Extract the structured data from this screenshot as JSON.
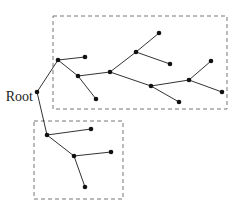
{
  "diagram": {
    "type": "tree",
    "root_label": "Root",
    "colors": {
      "edge": "#333333",
      "node": "#111111",
      "cluster_border": "#777777",
      "background": "#ffffff"
    },
    "nodes": [
      {
        "id": "root",
        "x": 37,
        "y": 92
      },
      {
        "id": "a",
        "x": 58,
        "y": 60
      },
      {
        "id": "a1",
        "x": 85,
        "y": 57
      },
      {
        "id": "b",
        "x": 78,
        "y": 76
      },
      {
        "id": "b1",
        "x": 96,
        "y": 99
      },
      {
        "id": "c",
        "x": 110,
        "y": 72
      },
      {
        "id": "d",
        "x": 136,
        "y": 52
      },
      {
        "id": "d1",
        "x": 159,
        "y": 33
      },
      {
        "id": "d2",
        "x": 170,
        "y": 64
      },
      {
        "id": "e",
        "x": 151,
        "y": 86
      },
      {
        "id": "e1",
        "x": 179,
        "y": 102
      },
      {
        "id": "f",
        "x": 189,
        "y": 80
      },
      {
        "id": "f1",
        "x": 211,
        "y": 61
      },
      {
        "id": "f2",
        "x": 222,
        "y": 92
      },
      {
        "id": "g",
        "x": 47,
        "y": 135
      },
      {
        "id": "g1",
        "x": 91,
        "y": 129
      },
      {
        "id": "h",
        "x": 74,
        "y": 156
      },
      {
        "id": "h1",
        "x": 111,
        "y": 152
      },
      {
        "id": "h2",
        "x": 85,
        "y": 187
      }
    ],
    "edges": [
      [
        "root",
        "a"
      ],
      [
        "a",
        "a1"
      ],
      [
        "a",
        "b"
      ],
      [
        "b",
        "b1"
      ],
      [
        "b",
        "c"
      ],
      [
        "c",
        "d"
      ],
      [
        "d",
        "d1"
      ],
      [
        "d",
        "d2"
      ],
      [
        "c",
        "e"
      ],
      [
        "e",
        "e1"
      ],
      [
        "e",
        "f"
      ],
      [
        "f",
        "f1"
      ],
      [
        "f",
        "f2"
      ],
      [
        "root",
        "g"
      ],
      [
        "g",
        "g1"
      ],
      [
        "g",
        "h"
      ],
      [
        "h",
        "h1"
      ],
      [
        "h",
        "h2"
      ]
    ],
    "clusters": [
      {
        "id": "upper-subtree",
        "x": 53,
        "y": 16,
        "w": 174,
        "h": 93
      },
      {
        "id": "lower-subtree",
        "x": 34,
        "y": 121,
        "w": 89,
        "h": 78
      }
    ]
  }
}
